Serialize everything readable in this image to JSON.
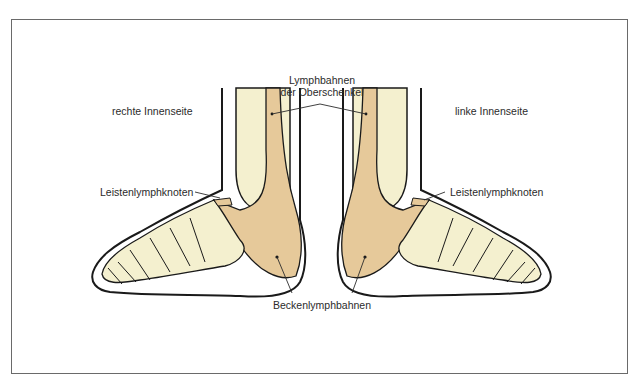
{
  "diagram": {
    "type": "anatomical-foot-map",
    "colors": {
      "frame": "#6a6a6a",
      "bone": "#f4f0cf",
      "lymph_zone": "#e6c99a",
      "outline": "#1a1a1a",
      "skin": "#ffffff",
      "text": "#2b2b2b"
    },
    "labels": {
      "right_side": "rechte Innenseite",
      "left_side": "linke Innenseite",
      "thigh_lymph_line1": "Lymphbahnen",
      "thigh_lymph_line2": "der Oberschenkel",
      "inguinal_nodes_left": "Leistenlymphknoten",
      "inguinal_nodes_right": "Leistenlymphknoten",
      "pelvic_lymph": "Beckenlymphbahnen"
    },
    "feet": [
      {
        "side": "right",
        "label_ref": "right_side",
        "toes_direction": "left"
      },
      {
        "side": "left",
        "label_ref": "left_side",
        "toes_direction": "right"
      }
    ]
  }
}
